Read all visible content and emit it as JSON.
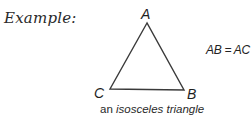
{
  "header": {
    "label": "Example:"
  },
  "diagram": {
    "shape": "triangle",
    "vertices": [
      {
        "name": "A",
        "x": 147,
        "y": 23
      },
      {
        "name": "C",
        "x": 110,
        "y": 89
      },
      {
        "name": "B",
        "x": 184,
        "y": 90
      }
    ],
    "stroke_color": "#3a3a3a"
  },
  "labels": {
    "a": "A",
    "b": "B",
    "c": "C"
  },
  "equation": "AB = AC",
  "caption": {
    "prefix": "an ",
    "emphasis": "isosceles triangle"
  }
}
